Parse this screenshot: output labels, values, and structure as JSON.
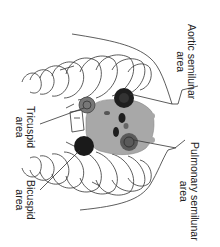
{
  "diagram": {
    "orientation": "rotated 90deg clockwise",
    "labels": {
      "aortic": {
        "line1": "Aortic semilunar",
        "line2": "area"
      },
      "pulmonary": {
        "line1": "Pulmonary semilunar",
        "line2": "area"
      },
      "tricuspid": {
        "line1": "Tricuspid",
        "line2": "area"
      },
      "bicuspid": {
        "line1": "Bicuspid",
        "line2": "area"
      }
    },
    "colors": {
      "heart": "#a8a8a8",
      "marker_dark": "#1e1e1e",
      "marker_ringed": "#6a6a6a",
      "line": "#333333"
    }
  }
}
